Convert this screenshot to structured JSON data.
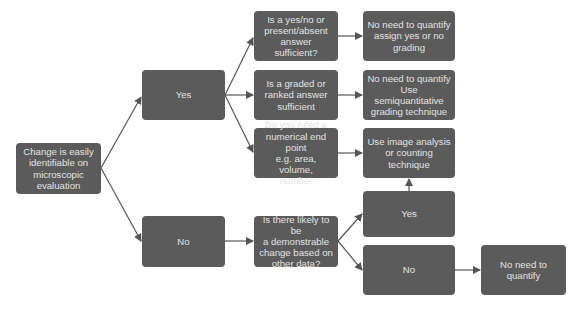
{
  "diagram": {
    "type": "flowchart",
    "colors": {
      "node_fill": "#5b5b5b",
      "node_text": "#e2e2e2",
      "edge": "#555555",
      "background": "#ffffff"
    },
    "nodes": {
      "start": {
        "label": "Change is easily\nidentifiable on\nmicroscopic\nevaluation"
      },
      "yes_main": {
        "label": "Yes"
      },
      "no_main": {
        "label": "No"
      },
      "q_yesno": {
        "label": "Is a yes/no or\npresent/absent\nanswer sufficient?"
      },
      "q_graded": {
        "label": "Is a graded or\nranked answer\nsufficient"
      },
      "q_numerical": {
        "label": "Do you need a\nnumerical end point\ne.g. area, volume,\nnumber"
      },
      "q_likely": {
        "label": "Is there likely to be\na demonstrable\nchange based on\nother data?"
      },
      "r_yesno": {
        "label": "No need to quantify\nassign yes or no\ngrading"
      },
      "r_semiquant": {
        "label": "No need to quantify\nUse semiquantitative\ngrading technique"
      },
      "r_image": {
        "label": "Use image analysis\nor counting\ntechnique"
      },
      "likely_yes": {
        "label": "Yes"
      },
      "likely_no": {
        "label": "No"
      },
      "r_noquant": {
        "label": "No need to\nquantify"
      }
    },
    "edges": [
      {
        "from": "start",
        "to": "yes_main"
      },
      {
        "from": "start",
        "to": "no_main"
      },
      {
        "from": "yes_main",
        "to": "q_yesno"
      },
      {
        "from": "yes_main",
        "to": "q_graded"
      },
      {
        "from": "yes_main",
        "to": "q_numerical"
      },
      {
        "from": "q_yesno",
        "to": "r_yesno"
      },
      {
        "from": "q_graded",
        "to": "r_semiquant"
      },
      {
        "from": "q_numerical",
        "to": "r_image"
      },
      {
        "from": "no_main",
        "to": "q_likely"
      },
      {
        "from": "q_likely",
        "to": "likely_yes"
      },
      {
        "from": "q_likely",
        "to": "likely_no"
      },
      {
        "from": "likely_yes",
        "to": "r_image"
      },
      {
        "from": "likely_no",
        "to": "r_noquant"
      }
    ]
  }
}
